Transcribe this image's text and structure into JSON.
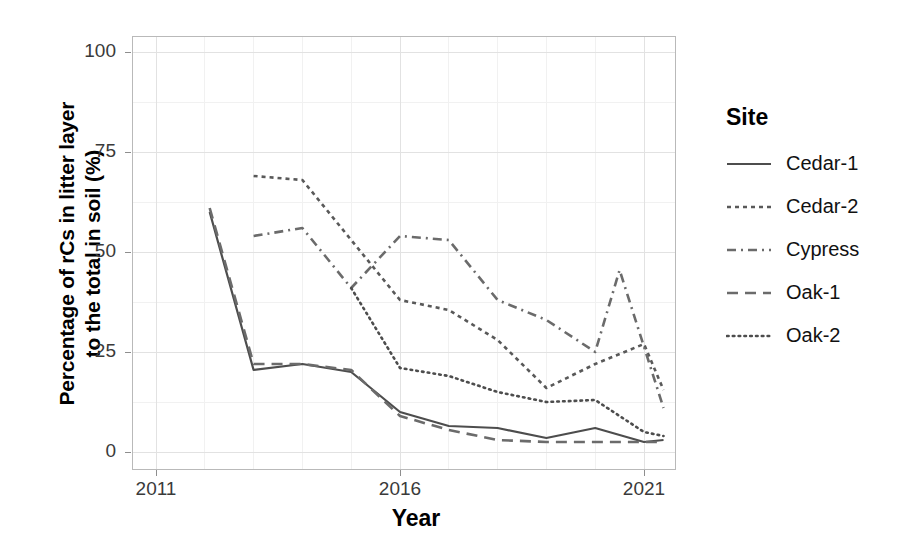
{
  "chart_data": {
    "type": "line",
    "title": "",
    "xlabel": "Year",
    "ylabel": "Percentage of rCs in litter layer\nto the total in soil (%)",
    "xlim": [
      2011,
      2022
    ],
    "ylim": [
      0,
      100
    ],
    "xticks": [
      2011,
      2016,
      2021
    ],
    "xticklabels": [
      "2011",
      "2016",
      "2021"
    ],
    "yticks": [
      0,
      25,
      50,
      75,
      100
    ],
    "yticklabels": [
      "0",
      "25",
      "50",
      "75",
      "100"
    ],
    "grid": true,
    "legend_position": "right",
    "legend_title": "Site",
    "series": [
      {
        "name": "Cedar-1",
        "dash": "solid",
        "color": "#4d4d4d",
        "x": [
          2012.1,
          2013.0,
          2014.0,
          2015.0,
          2016.0,
          2017.0,
          2018.0,
          2019.0,
          2020.0,
          2021.0,
          2021.4
        ],
        "y": [
          60.0,
          20.5,
          22.0,
          20.0,
          10.0,
          6.5,
          6.0,
          3.5,
          6.0,
          2.5,
          3.0
        ]
      },
      {
        "name": "Cedar-2",
        "dash": "short-dash",
        "color": "#595959",
        "x": [
          2013.0,
          2014.0,
          2015.0,
          2016.0,
          2017.0,
          2018.0,
          2019.0,
          2020.0,
          2021.0,
          2021.4
        ],
        "y": [
          69.0,
          68.0,
          53.0,
          38.0,
          35.5,
          28.0,
          16.0,
          22.0,
          27.0,
          15.5
        ]
      },
      {
        "name": "Cypress",
        "dash": "dash-dot",
        "color": "#6b6b6b",
        "x": [
          2013.0,
          2014.0,
          2015.0,
          2016.0,
          2017.0,
          2018.0,
          2019.0,
          2020.0,
          2020.5,
          2021.4
        ],
        "y": [
          54.0,
          56.0,
          41.0,
          54.0,
          53.0,
          38.0,
          33.0,
          25.0,
          45.5,
          11.0
        ]
      },
      {
        "name": "Oak-1",
        "dash": "long-dash",
        "color": "#6b6b6b",
        "x": [
          2012.1,
          2013.0,
          2014.0,
          2015.0,
          2016.0,
          2017.0,
          2018.0,
          2019.0,
          2020.0,
          2021.0,
          2021.4
        ],
        "y": [
          61.0,
          22.0,
          22.0,
          20.5,
          9.0,
          5.5,
          3.0,
          2.5,
          2.5,
          2.5,
          2.5
        ]
      },
      {
        "name": "Oak-2",
        "dash": "dotted",
        "color": "#4d4d4d",
        "x": [
          2015.0,
          2016.0,
          2017.0,
          2018.0,
          2019.0,
          2020.0,
          2021.0,
          2021.4
        ],
        "y": [
          41.0,
          21.0,
          19.0,
          15.0,
          12.5,
          13.0,
          5.0,
          4.0
        ]
      }
    ]
  },
  "axes": {
    "x_title": "Year",
    "y_title": "Percentage of rCs in litter layer\nto the total in soil (%)",
    "x_ticks": [
      {
        "label": "2011",
        "value": 2011
      },
      {
        "label": "2016",
        "value": 2016
      },
      {
        "label": "2021",
        "value": 2021
      }
    ],
    "y_ticks": [
      {
        "label": "100",
        "value": 100
      },
      {
        "label": "75",
        "value": 75
      },
      {
        "label": "50",
        "value": 50
      },
      {
        "label": "25",
        "value": 25
      },
      {
        "label": "0",
        "value": 0
      }
    ]
  },
  "legend": {
    "title": "Site",
    "items": [
      {
        "label": "Cedar-1",
        "dash": "solid"
      },
      {
        "label": "Cedar-2",
        "dash": "short-dash"
      },
      {
        "label": "Cypress",
        "dash": "dash-dot"
      },
      {
        "label": "Oak-1",
        "dash": "long-dash"
      },
      {
        "label": "Oak-2",
        "dash": "dotted"
      }
    ]
  },
  "style": {
    "panel_border": "#b9b9b9",
    "major_grid": "#e2e2e2",
    "minor_grid": "#f1f1f1",
    "line_color": "#4d4d4d",
    "text_color": "#111111"
  }
}
